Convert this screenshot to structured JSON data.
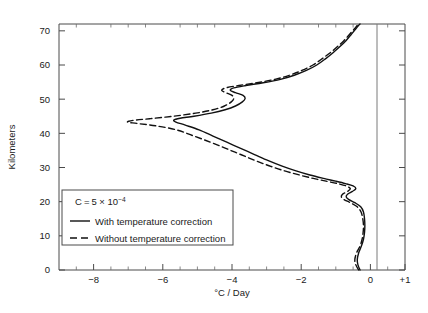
{
  "chart_data": {
    "type": "line",
    "title": "",
    "xlabel": "°C / Day",
    "ylabel": "Kilometers",
    "xlim": [
      -9,
      1
    ],
    "ylim": [
      0,
      72
    ],
    "xticks": [
      -8,
      -6,
      -4,
      -2,
      0,
      1
    ],
    "xtick_labels": [
      "−8",
      "−6",
      "−4",
      "−2",
      "0",
      "+1"
    ],
    "yticks": [
      0,
      10,
      20,
      30,
      40,
      50,
      60,
      70
    ],
    "ytick_labels": [
      "0",
      "10",
      "20",
      "30",
      "40",
      "50",
      "60",
      "70"
    ],
    "minor_xticks": [
      -8.5,
      -7.5,
      -7,
      -6.5,
      -5.5,
      -5,
      -4.5,
      -3.5,
      -3,
      -2.5,
      -1.5,
      -1,
      -0.5,
      0.5
    ],
    "grid": false,
    "zero_line": 0,
    "legend_position": "lower-left-inside",
    "annotation": {
      "symbol": "C",
      "equals": "=",
      "value": "5 × 10",
      "exponent": "−4"
    },
    "series": [
      {
        "name": "With temperature correction",
        "style": "solid",
        "color": "#111111",
        "xlabel_axis": "°C / Day",
        "points": [
          [
            -0.3,
            0.0
          ],
          [
            -0.36,
            1.5
          ],
          [
            -0.38,
            3.0
          ],
          [
            -0.34,
            5.0
          ],
          [
            -0.26,
            7.0
          ],
          [
            -0.2,
            9.0
          ],
          [
            -0.17,
            11.0
          ],
          [
            -0.16,
            13.0
          ],
          [
            -0.17,
            15.0
          ],
          [
            -0.2,
            17.0
          ],
          [
            -0.28,
            18.5
          ],
          [
            -0.45,
            19.7
          ],
          [
            -0.62,
            20.6
          ],
          [
            -0.7,
            21.4
          ],
          [
            -0.66,
            22.2
          ],
          [
            -0.52,
            23.0
          ],
          [
            -0.42,
            23.8
          ],
          [
            -0.5,
            24.6
          ],
          [
            -0.72,
            25.3
          ],
          [
            -1.0,
            26.0
          ],
          [
            -1.35,
            26.8
          ],
          [
            -1.75,
            27.8
          ],
          [
            -2.15,
            29.0
          ],
          [
            -2.55,
            30.4
          ],
          [
            -2.95,
            32.0
          ],
          [
            -3.35,
            33.8
          ],
          [
            -3.75,
            35.6
          ],
          [
            -4.15,
            37.4
          ],
          [
            -4.55,
            39.2
          ],
          [
            -4.95,
            41.0
          ],
          [
            -5.35,
            42.4
          ],
          [
            -5.62,
            43.3
          ],
          [
            -5.68,
            43.9
          ],
          [
            -5.5,
            44.4
          ],
          [
            -5.1,
            45.0
          ],
          [
            -4.6,
            45.9
          ],
          [
            -4.2,
            46.9
          ],
          [
            -3.9,
            48.0
          ],
          [
            -3.7,
            49.2
          ],
          [
            -3.62,
            50.2
          ],
          [
            -3.68,
            51.1
          ],
          [
            -3.9,
            51.9
          ],
          [
            -4.05,
            52.6
          ],
          [
            -3.95,
            53.3
          ],
          [
            -3.6,
            54.0
          ],
          [
            -3.1,
            54.8
          ],
          [
            -2.6,
            55.8
          ],
          [
            -2.2,
            57.0
          ],
          [
            -1.85,
            58.4
          ],
          [
            -1.55,
            60.0
          ],
          [
            -1.3,
            61.8
          ],
          [
            -1.08,
            63.6
          ],
          [
            -0.88,
            65.4
          ],
          [
            -0.7,
            67.2
          ],
          [
            -0.55,
            69.0
          ],
          [
            -0.42,
            70.6
          ],
          [
            -0.34,
            71.6
          ],
          [
            -0.3,
            72.0
          ]
        ]
      },
      {
        "name": "Without temperature correction",
        "style": "dashed",
        "color": "#111111",
        "points": [
          [
            -0.34,
            0.0
          ],
          [
            -0.42,
            1.5
          ],
          [
            -0.45,
            3.0
          ],
          [
            -0.4,
            5.0
          ],
          [
            -0.3,
            7.0
          ],
          [
            -0.24,
            9.0
          ],
          [
            -0.21,
            11.0
          ],
          [
            -0.2,
            13.0
          ],
          [
            -0.22,
            15.0
          ],
          [
            -0.27,
            17.0
          ],
          [
            -0.38,
            18.5
          ],
          [
            -0.58,
            19.7
          ],
          [
            -0.76,
            20.6
          ],
          [
            -0.84,
            21.4
          ],
          [
            -0.8,
            22.2
          ],
          [
            -0.66,
            23.0
          ],
          [
            -0.58,
            23.8
          ],
          [
            -0.7,
            24.6
          ],
          [
            -0.95,
            25.3
          ],
          [
            -1.28,
            26.0
          ],
          [
            -1.65,
            26.8
          ],
          [
            -2.05,
            27.8
          ],
          [
            -2.48,
            29.0
          ],
          [
            -2.9,
            30.4
          ],
          [
            -3.32,
            32.0
          ],
          [
            -3.75,
            33.8
          ],
          [
            -4.18,
            35.6
          ],
          [
            -4.62,
            37.4
          ],
          [
            -5.1,
            39.2
          ],
          [
            -5.6,
            41.0
          ],
          [
            -6.2,
            42.2
          ],
          [
            -6.75,
            42.9
          ],
          [
            -7.02,
            43.3
          ],
          [
            -6.85,
            43.8
          ],
          [
            -6.35,
            44.3
          ],
          [
            -5.7,
            45.0
          ],
          [
            -5.05,
            45.9
          ],
          [
            -4.55,
            46.9
          ],
          [
            -4.22,
            48.0
          ],
          [
            -4.02,
            49.2
          ],
          [
            -3.95,
            50.2
          ],
          [
            -4.0,
            51.1
          ],
          [
            -4.18,
            51.9
          ],
          [
            -4.3,
            52.6
          ],
          [
            -4.18,
            53.3
          ],
          [
            -3.8,
            54.0
          ],
          [
            -3.28,
            54.8
          ],
          [
            -2.76,
            55.8
          ],
          [
            -2.34,
            57.0
          ],
          [
            -1.98,
            58.4
          ],
          [
            -1.66,
            60.0
          ],
          [
            -1.4,
            61.8
          ],
          [
            -1.16,
            63.6
          ],
          [
            -0.95,
            65.4
          ],
          [
            -0.76,
            67.2
          ],
          [
            -0.6,
            69.0
          ],
          [
            -0.46,
            70.6
          ],
          [
            -0.38,
            71.6
          ],
          [
            -0.34,
            72.0
          ]
        ]
      }
    ]
  },
  "legend": {
    "items": [
      {
        "label": "With temperature correction",
        "style": "solid"
      },
      {
        "label": "Without temperature correction",
        "style": "dashed"
      }
    ]
  }
}
